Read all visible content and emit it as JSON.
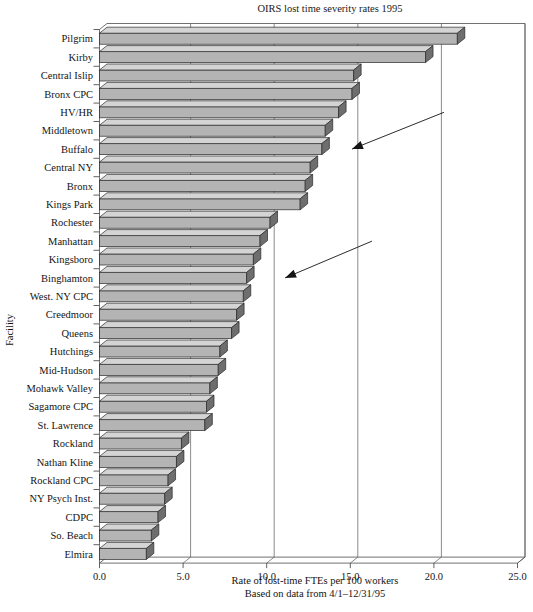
{
  "chart_data": {
    "type": "bar",
    "orientation": "horizontal",
    "title": "OIRS lost time severity rates 1995",
    "xlabel": "Rate of lost-time FTEs per 100 workers",
    "xlabel_line2": "Based on data from 4/1–12/31/95",
    "ylabel": "Facility",
    "xlim": [
      0.0,
      25.0
    ],
    "xticks": [
      0.0,
      5.0,
      10.0,
      15.0,
      20.0,
      25.0
    ],
    "xtick_labels": [
      "0.0",
      "5.0",
      "10.0",
      "15.0",
      "20.0",
      "25.0"
    ],
    "grid": "vertical",
    "legend": "none",
    "style": "3d-bars",
    "categories": [
      "Pilgrim",
      "Kirby",
      "Central Islip",
      "Bronx CPC",
      "HV/HR",
      "Middletown",
      "Buffalo",
      "Central NY",
      "Bronx",
      "Kings Park",
      "Rochester",
      "Manhattan",
      "Kingsboro",
      "Binghamton",
      "West. NY CPC",
      "Creedmoor",
      "Queens",
      "Hutchings",
      "Mid-Hudson",
      "Mohawk Valley",
      "Sagamore CPC",
      "St. Lawrence",
      "Rockland",
      "Nathan Kline",
      "Rockland CPC",
      "NY Psych Inst.",
      "CDPC",
      "So. Beach",
      "Elmira"
    ],
    "values": [
      21.4,
      19.5,
      15.2,
      15.1,
      14.3,
      13.5,
      13.3,
      12.6,
      12.3,
      12.0,
      10.2,
      9.6,
      9.2,
      8.8,
      8.6,
      8.2,
      7.9,
      7.2,
      7.1,
      6.6,
      6.4,
      6.3,
      4.9,
      4.6,
      4.1,
      3.9,
      3.5,
      3.1,
      2.8
    ],
    "bar_fill_color": "#b4b4b4",
    "bar_top_color": "#d4d4d4",
    "bar_side_color": "#6e6e6e",
    "annotations": [
      {
        "name": "upper-arrow",
        "type": "arrow",
        "from_value": 20.6,
        "from_category_index": 4,
        "to_value": 15.1,
        "to_category_index": 6
      },
      {
        "name": "lower-arrow",
        "type": "arrow",
        "from_value": 16.3,
        "from_category_index": 11,
        "to_value": 11.1,
        "to_category_index": 13
      }
    ]
  }
}
